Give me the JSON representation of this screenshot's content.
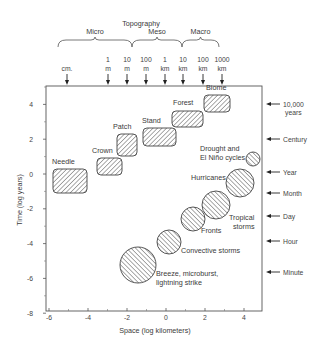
{
  "title": "Topography",
  "scale_groups": [
    {
      "label": "Micro",
      "x1": 58,
      "x2": 132
    },
    {
      "label": "Meso",
      "x1": 132,
      "x2": 182
    },
    {
      "label": "Macro",
      "x1": 182,
      "x2": 219
    }
  ],
  "top_markers": [
    {
      "line1": "",
      "line2": "cm.",
      "x": 67
    },
    {
      "line1": "1",
      "line2": "m",
      "x": 108
    },
    {
      "line1": "10",
      "line2": "m",
      "x": 127
    },
    {
      "line1": "100",
      "line2": "m",
      "x": 146
    },
    {
      "line1": "1",
      "line2": "km",
      "x": 165
    },
    {
      "line1": "10",
      "line2": "km",
      "x": 183
    },
    {
      "line1": "100",
      "line2": "km",
      "x": 203
    },
    {
      "line1": "1000",
      "line2": "km",
      "x": 222
    }
  ],
  "right_markers": [
    {
      "line1": "10,000",
      "line2": "years",
      "y": 104
    },
    {
      "line1": "Century",
      "line2": "",
      "y": 139
    },
    {
      "line1": "Year",
      "line2": "",
      "y": 172
    },
    {
      "line1": "Month",
      "line2": "",
      "y": 193
    },
    {
      "line1": "Day",
      "line2": "",
      "y": 216
    },
    {
      "line1": "Hour",
      "line2": "",
      "y": 241
    },
    {
      "line1": "Minute",
      "line2": "",
      "y": 272
    }
  ],
  "x_axis": {
    "label": "Space  (log kilometers)",
    "ticks": [
      "-6",
      "-4",
      "-2",
      "0",
      "2",
      "4"
    ]
  },
  "y_axis": {
    "label": "Time (log years)",
    "ticks": [
      "4",
      "2",
      "0",
      "-2",
      "-4",
      "-6",
      "-8"
    ]
  },
  "biological_scales": [
    {
      "label": "Needle",
      "x": 53,
      "y": 169,
      "w": 34,
      "h": 24,
      "lx": 52,
      "ly": 164
    },
    {
      "label": "Crown",
      "x": 97,
      "y": 158,
      "w": 25,
      "h": 17,
      "lx": 92,
      "ly": 153
    },
    {
      "label": "Patch",
      "x": 117,
      "y": 134,
      "w": 20,
      "h": 22,
      "lx": 113,
      "ly": 129
    },
    {
      "label": "Stand",
      "x": 143,
      "y": 128,
      "w": 33,
      "h": 18,
      "lx": 142,
      "ly": 123
    },
    {
      "label": "Forest",
      "x": 172,
      "y": 111,
      "w": 31,
      "h": 16,
      "lx": 173,
      "ly": 105
    },
    {
      "label": "Biome",
      "x": 204,
      "y": 95,
      "w": 26,
      "h": 17,
      "lx": 206,
      "ly": 90
    }
  ],
  "atmospheric_phenomena": [
    {
      "label": "Drought  and",
      "label2": "El Niño cycles",
      "cx": 253,
      "cy": 159,
      "r": 7,
      "lx": 200,
      "ly": 151,
      "anchor": "start"
    },
    {
      "label": "Hurricanes",
      "label2": "",
      "cx": 240,
      "cy": 183,
      "r": 14,
      "lx": 191,
      "ly": 180,
      "anchor": "start"
    },
    {
      "label": "Tropical",
      "label2": "storms",
      "cx": 216,
      "cy": 205,
      "r": 14,
      "lx": 229,
      "ly": 220,
      "anchor": "start"
    },
    {
      "label": "Fronts",
      "label2": "",
      "cx": 193,
      "cy": 219,
      "r": 12,
      "lx": 201,
      "ly": 233,
      "anchor": "start"
    },
    {
      "label": "Convective storms",
      "label2": "",
      "cx": 169,
      "cy": 242,
      "r": 12,
      "lx": 181,
      "ly": 253,
      "anchor": "start"
    },
    {
      "label": "Breeze, microburst,",
      "label2": "lightning strike",
      "cx": 138,
      "cy": 265,
      "r": 18,
      "lx": 156,
      "ly": 276,
      "anchor": "start"
    }
  ],
  "chart_data": {
    "type": "scatter",
    "title": "Topography",
    "xlabel": "Space (log kilometers)",
    "ylabel": "Time (log years)",
    "xlim": [
      -6,
      5
    ],
    "ylim": [
      -8,
      5
    ],
    "grid": false,
    "series": [
      {
        "name": "Vegetation scales (rectangles)",
        "points": [
          {
            "label": "Needle",
            "x": -5,
            "y": -0.5
          },
          {
            "label": "Crown",
            "x": -3.3,
            "y": 0.6
          },
          {
            "label": "Patch",
            "x": -2.3,
            "y": 1.6
          },
          {
            "label": "Stand",
            "x": -0.9,
            "y": 2.1
          },
          {
            "label": "Forest",
            "x": 0.7,
            "y": 3.2
          },
          {
            "label": "Biome",
            "x": 2.5,
            "y": 4.1
          }
        ]
      },
      {
        "name": "Atmospheric phenomena (circles)",
        "points": [
          {
            "label": "Drought and El Niño cycles",
            "x": 4.5,
            "y": 0.9
          },
          {
            "label": "Hurricanes",
            "x": 3.8,
            "y": -0.5
          },
          {
            "label": "Tropical storms",
            "x": 2.6,
            "y": -1.8
          },
          {
            "label": "Fronts",
            "x": 1.4,
            "y": -2.6
          },
          {
            "label": "Convective storms",
            "x": 0.2,
            "y": -3.9
          },
          {
            "label": "Breeze, microburst, lightning strike",
            "x": -1.4,
            "y": -5.2
          }
        ]
      }
    ],
    "top_scale_labels": [
      "cm.",
      "1 m",
      "10 m",
      "100 m",
      "1 km",
      "10 km",
      "100 km",
      "1000 km"
    ],
    "top_scale_groups": [
      "Micro",
      "Meso",
      "Macro"
    ],
    "right_time_labels": [
      "10,000 years",
      "Century",
      "Year",
      "Month",
      "Day",
      "Hour",
      "Minute"
    ]
  }
}
